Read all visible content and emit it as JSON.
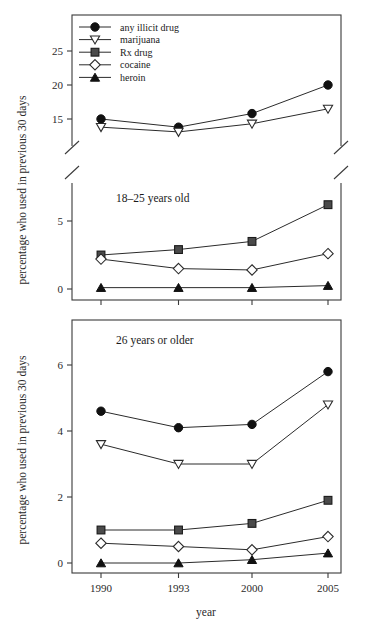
{
  "figure": {
    "xlabel": "year",
    "ylabel": "percentage who used in previous 30 days"
  },
  "legend": {
    "items": [
      {
        "label": "any illicit drug",
        "marker": "filled-circle"
      },
      {
        "label": "marijuana",
        "marker": "open-down-triangle"
      },
      {
        "label": "Rx drug",
        "marker": "grey-square"
      },
      {
        "label": "cocaine",
        "marker": "open-diamond"
      },
      {
        "label": "heroin",
        "marker": "filled-up-triangle"
      }
    ]
  },
  "panels": [
    {
      "label": "18–25 years old",
      "ylabel": "percentage who used in previous 30 days",
      "yticks": [
        "0",
        "5",
        "15",
        "20",
        "25"
      ],
      "xticks": [
        "1990",
        "1993",
        "2000",
        "2005"
      ],
      "axis_break": true
    },
    {
      "label": "26 years or older",
      "ylabel": "percentage who used in previous 30 days",
      "yticks": [
        "0",
        "2",
        "4",
        "6"
      ],
      "xticks": [
        "1990",
        "1993",
        "2000",
        "2005"
      ],
      "axis_break": false
    }
  ],
  "chart_data": [
    {
      "type": "line",
      "title": "18–25 years old",
      "xlabel": "year",
      "ylabel": "percentage who used in previous 30 days",
      "categories": [
        "1990",
        "1993",
        "2000",
        "2005"
      ],
      "x": [
        1990,
        1993,
        2000,
        2005
      ],
      "ylim": [
        0,
        26
      ],
      "axis_break": {
        "from": 6.2,
        "to": 13.5
      },
      "yticks": [
        0,
        5,
        15,
        20,
        25
      ],
      "grid": false,
      "legend_position": "top-left",
      "series": [
        {
          "name": "any illicit drug",
          "marker": "filled-circle",
          "values": [
            15.0,
            13.8,
            15.8,
            20.0
          ]
        },
        {
          "name": "marijuana",
          "marker": "open-down-triangle",
          "values": [
            13.8,
            13.1,
            14.3,
            16.5
          ]
        },
        {
          "name": "Rx drug",
          "marker": "grey-square",
          "values": [
            2.5,
            2.9,
            3.5,
            6.2
          ]
        },
        {
          "name": "cocaine",
          "marker": "open-diamond",
          "values": [
            2.2,
            1.5,
            1.4,
            2.6
          ]
        },
        {
          "name": "heroin",
          "marker": "filled-up-triangle",
          "values": [
            0.1,
            0.1,
            0.1,
            0.25
          ]
        }
      ]
    },
    {
      "type": "line",
      "title": "26 years or older",
      "xlabel": "year",
      "ylabel": "percentage who used in previous 30 days",
      "categories": [
        "1990",
        "1993",
        "2000",
        "2005"
      ],
      "x": [
        1990,
        1993,
        2000,
        2005
      ],
      "ylim": [
        -0.35,
        6.75
      ],
      "yticks": [
        0,
        2,
        4,
        6
      ],
      "grid": false,
      "legend_position": "none",
      "series": [
        {
          "name": "any illicit drug",
          "marker": "filled-circle",
          "values": [
            4.6,
            4.1,
            4.2,
            5.8
          ]
        },
        {
          "name": "marijuana",
          "marker": "open-down-triangle",
          "values": [
            3.6,
            3.0,
            3.0,
            4.8
          ]
        },
        {
          "name": "Rx drug",
          "marker": "grey-square",
          "values": [
            1.0,
            1.0,
            1.2,
            1.9
          ]
        },
        {
          "name": "cocaine",
          "marker": "open-diamond",
          "values": [
            0.6,
            0.5,
            0.4,
            0.8
          ]
        },
        {
          "name": "heroin",
          "marker": "filled-up-triangle",
          "values": [
            0.0,
            0.0,
            0.1,
            0.3
          ]
        }
      ]
    }
  ]
}
